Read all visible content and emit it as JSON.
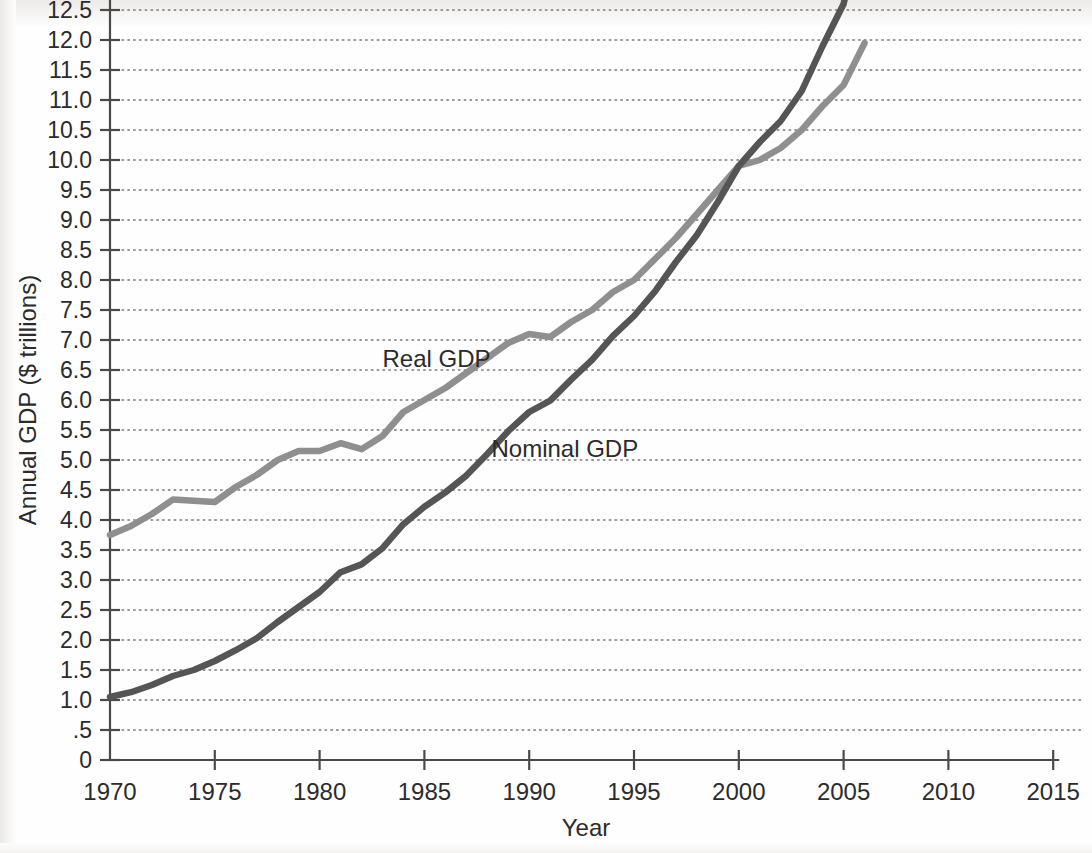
{
  "chart_data": {
    "type": "line",
    "title": "",
    "xlabel": "Year",
    "ylabel": "Annual GDP ($ trillions)",
    "xlim": [
      1970,
      2015
    ],
    "ylim": [
      0,
      14.75
    ],
    "grid": true,
    "legend_position": "inline-annotation",
    "xticks": [
      "1970",
      "1975",
      "1980",
      "1985",
      "1990",
      "1995",
      "2000",
      "2005",
      "2010",
      "2015"
    ],
    "xtick_values": [
      1970,
      1975,
      1980,
      1985,
      1990,
      1995,
      2000,
      2005,
      2010,
      2015
    ],
    "yticks": [
      "0",
      ".5",
      "1.0",
      "1.5",
      "2.0",
      "2.5",
      "3.0",
      "3.5",
      "4.0",
      "4.5",
      "5.0",
      "5.5",
      "6.0",
      "6.5",
      "7.0",
      "7.5",
      "8.0",
      "8.5",
      "9.0",
      "9.5",
      "10.0",
      "10.5",
      "11.0",
      "11.5",
      "12.0",
      "12.5",
      "13.0",
      "13.5",
      "14.0",
      "14.5"
    ],
    "ytick_values": [
      0,
      0.5,
      1.0,
      1.5,
      2.0,
      2.5,
      3.0,
      3.5,
      4.0,
      4.5,
      5.0,
      5.5,
      6.0,
      6.5,
      7.0,
      7.5,
      8.0,
      8.5,
      9.0,
      9.5,
      10.0,
      10.5,
      11.0,
      11.5,
      12.0,
      12.5,
      13.0,
      13.5,
      14.0,
      14.5
    ],
    "x": [
      1970,
      1971,
      1972,
      1973,
      1974,
      1975,
      1976,
      1977,
      1978,
      1979,
      1980,
      1981,
      1982,
      1983,
      1984,
      1985,
      1986,
      1987,
      1988,
      1989,
      1990,
      1991,
      1992,
      1993,
      1994,
      1995,
      1996,
      1997,
      1998,
      1999,
      2000,
      2001,
      2002,
      2003,
      2004,
      2005,
      2006
    ],
    "series": [
      {
        "name": "Real GDP",
        "color": "#8f8f8f",
        "label_x": 1983.0,
        "label_y": 6.55,
        "values": [
          3.75,
          3.9,
          4.1,
          4.34,
          4.32,
          4.3,
          4.55,
          4.75,
          5.0,
          5.15,
          5.15,
          5.28,
          5.18,
          5.4,
          5.8,
          6.0,
          6.2,
          6.45,
          6.7,
          6.95,
          7.1,
          7.05,
          7.3,
          7.5,
          7.8,
          8.0,
          8.35,
          8.7,
          9.1,
          9.5,
          9.9,
          10.0,
          10.2,
          10.5,
          10.9,
          11.25,
          11.95
        ],
        "end_value": 11.95
      },
      {
        "name": "Nominal GDP",
        "color": "#555555",
        "label_x": 1988.2,
        "label_y": 5.05,
        "values": [
          1.05,
          1.13,
          1.25,
          1.4,
          1.5,
          1.65,
          1.83,
          2.03,
          2.3,
          2.55,
          2.8,
          3.13,
          3.26,
          3.53,
          3.93,
          4.22,
          4.46,
          4.74,
          5.1,
          5.48,
          5.8,
          5.99,
          6.34,
          6.67,
          7.07,
          7.4,
          7.81,
          8.3,
          8.75,
          9.3,
          9.9,
          10.3,
          10.65,
          11.15,
          11.9,
          12.6,
          14.2
        ],
        "end_value": 14.2
      }
    ]
  }
}
